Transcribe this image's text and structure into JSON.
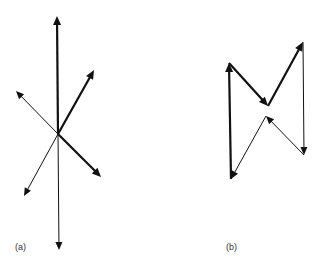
{
  "figure": {
    "panels": [
      {
        "label": "(a)",
        "description": "Six vectors radiating from a common origin",
        "origin": [
          58,
          134
        ],
        "vectors": [
          {
            "name": "up",
            "to": [
              57,
              16
            ],
            "weight": "thick"
          },
          {
            "name": "up-right",
            "to": [
              94,
              70
            ],
            "weight": "thick"
          },
          {
            "name": "up-left",
            "to": [
              16,
              91
            ],
            "weight": "thin"
          },
          {
            "name": "down-right",
            "to": [
              101,
              177
            ],
            "weight": "thick"
          },
          {
            "name": "down-left",
            "to": [
              24,
              196
            ],
            "weight": "thin"
          },
          {
            "name": "down",
            "to": [
              59,
              250
            ],
            "weight": "thin"
          }
        ]
      },
      {
        "label": "(b)",
        "description": "Same vectors arranged head-to-tail forming a closed polygon",
        "vectors": [
          {
            "name": "up",
            "from": [
              231,
              179
            ],
            "to": [
              229,
              63
            ],
            "weight": "thick"
          },
          {
            "name": "down-right",
            "from": [
              229,
              63
            ],
            "to": [
              268,
              106
            ],
            "weight": "thick"
          },
          {
            "name": "up-right",
            "from": [
              268,
              106
            ],
            "to": [
              303,
              42
            ],
            "weight": "thick"
          },
          {
            "name": "down",
            "from": [
              303,
              42
            ],
            "to": [
              304,
              155
            ],
            "weight": "thin"
          },
          {
            "name": "up-left",
            "from": [
              304,
              155
            ],
            "to": [
              266,
              116
            ],
            "weight": "thin"
          },
          {
            "name": "down-left",
            "from": [
              266,
              116
            ],
            "to": [
              231,
              179
            ],
            "weight": "thin"
          }
        ]
      }
    ],
    "colors": {
      "stroke": "#111111",
      "background": "#ffffff"
    }
  }
}
